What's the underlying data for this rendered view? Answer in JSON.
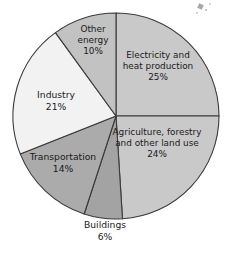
{
  "chart_data": {
    "type": "pie",
    "title": "",
    "subtitle": "",
    "xlabel": "",
    "ylabel": "",
    "legend_position": "none",
    "grid": false,
    "units": "percent",
    "start_angle_deg": 0,
    "direction": "clockwise",
    "center": {
      "x": 116,
      "y": 116
    },
    "radius": 103,
    "categories": [
      "Electricity and heat production",
      "Agriculture, forestry and other land use",
      "Buildings",
      "Transportation",
      "Industry",
      "Other energy"
    ],
    "values": [
      25,
      24,
      6,
      14,
      21,
      10
    ],
    "slices": [
      {
        "name": "electricity-and-heat-production",
        "label_line1": "Electricity and",
        "label_line2": "heat production",
        "label_line3": "25%",
        "value": 25,
        "percent_text": "25%",
        "color": "#c9c9c9",
        "label_placement": "inside",
        "label_x": 158,
        "label_y": 66
      },
      {
        "name": "agriculture-forestry-and-other-land-use",
        "label_line1": "Agriculture, forestry",
        "label_line2": "and other land use",
        "label_line3": "24%",
        "value": 24,
        "percent_text": "24%",
        "color": "#c9c9c9",
        "label_placement": "inside",
        "label_x": 157,
        "label_y": 143
      },
      {
        "name": "buildings",
        "label_line1": "Buildings",
        "label_line2": "6%",
        "label_line3": "",
        "value": 6,
        "percent_text": "6%",
        "color": "#a3a3a3",
        "label_placement": "outside-below",
        "label_x": 105,
        "label_y": 231
      },
      {
        "name": "transportation",
        "label_line1": "Transportation",
        "label_line2": "14%",
        "label_line3": "",
        "value": 14,
        "percent_text": "14%",
        "color": "#ababab",
        "label_placement": "inside",
        "label_x": 63,
        "label_y": 163
      },
      {
        "name": "industry",
        "label_line1": "Industry",
        "label_line2": "21%",
        "label_line3": "",
        "value": 21,
        "percent_text": "21%",
        "color": "#f2f2f2",
        "label_placement": "inside",
        "label_x": 56,
        "label_y": 101
      },
      {
        "name": "other-energy",
        "label_line1": "Other",
        "label_line2": "energy",
        "label_line3": "10%",
        "value": 10,
        "percent_text": "10%",
        "color": "#c2c2c2",
        "label_placement": "inside",
        "label_x": 93,
        "label_y": 40
      }
    ],
    "stroke_color": "#3a3a3a",
    "background_color": "#ffffff"
  }
}
